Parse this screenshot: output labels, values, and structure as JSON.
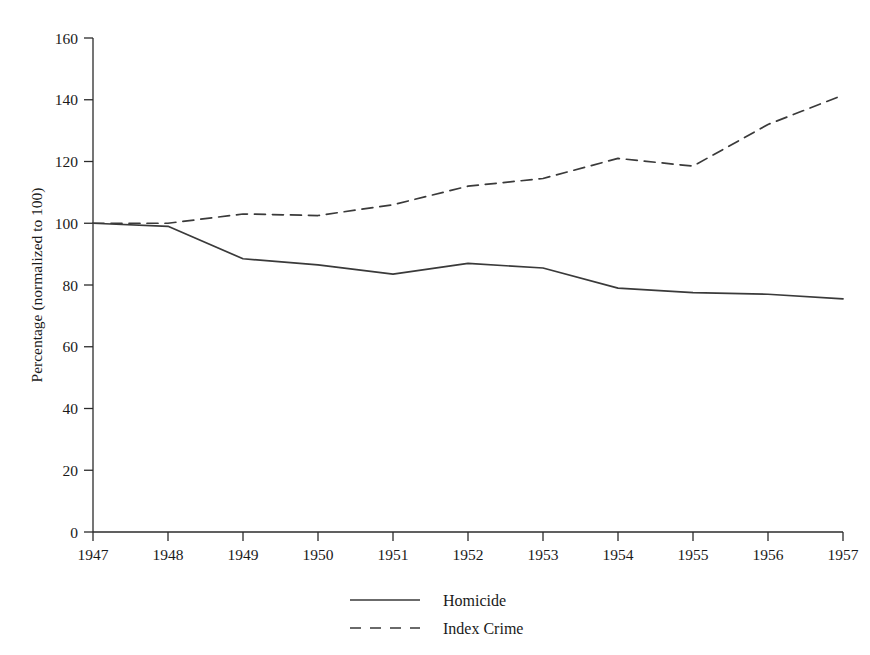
{
  "chart_data": {
    "type": "line",
    "title": "",
    "subtitle": "",
    "xlabel": "",
    "ylabel": "Percentage (normalized to 100)",
    "x": [
      1947,
      1948,
      1949,
      1950,
      1951,
      1952,
      1953,
      1954,
      1955,
      1956,
      1957
    ],
    "xticklabels": [
      "1947",
      "1948",
      "1949",
      "1950",
      "1951",
      "1952",
      "1953",
      "1954",
      "1955",
      "1956",
      "1957"
    ],
    "yticks": [
      0,
      20,
      40,
      60,
      80,
      100,
      120,
      140,
      160
    ],
    "yticklabels": [
      "0",
      "20",
      "40",
      "60",
      "80",
      "100",
      "120",
      "140",
      "160"
    ],
    "xlim": [
      1947,
      1957
    ],
    "ylim": [
      0,
      160
    ],
    "grid": false,
    "legend_position": "bottom-center",
    "series": [
      {
        "name": "Homicide",
        "style": "solid",
        "color": "#3a3a3a",
        "values": [
          100,
          99,
          88.5,
          86.5,
          83.5,
          87,
          85.5,
          79,
          77.5,
          77,
          75.5
        ]
      },
      {
        "name": "Index Crime",
        "style": "dashed",
        "color": "#3a3a3a",
        "values": [
          100,
          100,
          103,
          102.5,
          106,
          112,
          114.5,
          121,
          118.5,
          132,
          141.5
        ]
      }
    ],
    "annotations": []
  },
  "legend": {
    "entries": [
      {
        "label": "Homicide",
        "style": "solid"
      },
      {
        "label": "Index Crime",
        "style": "dashed"
      }
    ]
  }
}
